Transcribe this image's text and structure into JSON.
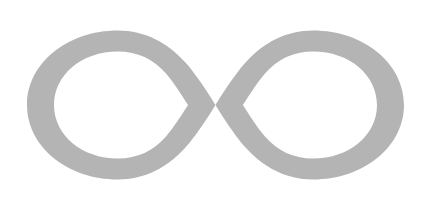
{
  "page": {
    "title": "Infinity Symbol",
    "background_color": "#FFFFFF",
    "width": 441,
    "height": 210
  },
  "figure": {
    "name": "infinity-symbol",
    "label": "Infinity symbol",
    "glyph": "∞",
    "fill_color": "#B4B4B4",
    "stroke_width_px": 35,
    "bounds": {
      "left": 27,
      "top": 19,
      "right": 404,
      "bottom": 192,
      "width": 377,
      "height": 173
    },
    "crossing_point": {
      "x": 215,
      "y": 105
    },
    "left_loop": {
      "name": "left-loop",
      "center_x": 116,
      "center_y": 105,
      "outer_radius_x": 89,
      "outer_radius_y": 86
    },
    "right_loop": {
      "name": "right-loop",
      "center_x": 315,
      "center_y": 105,
      "outer_radius_x": 89,
      "outer_radius_y": 86
    }
  }
}
